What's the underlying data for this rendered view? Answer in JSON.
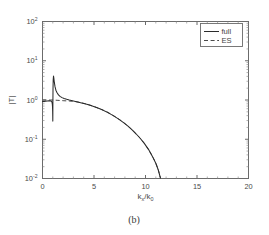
{
  "figure": {
    "caption": "(b)",
    "background": "#ffffff",
    "foreground": "#3a3a3a"
  },
  "chart_data": {
    "type": "line",
    "title": "",
    "subtitle": "",
    "caption": "(b)",
    "xlabel": "k_x/k_0",
    "xlabel_parts": {
      "base1": "k",
      "sub1": "x",
      "slash": "/",
      "base2": "k",
      "sub2": "0"
    },
    "ylabel": "|T|",
    "xscale": "linear",
    "yscale": "log",
    "xlim": [
      0,
      20
    ],
    "ylim": [
      0.01,
      100
    ],
    "grid": false,
    "xticks": [
      0,
      5,
      10,
      15,
      20
    ],
    "xticklabels": [
      "0",
      "5",
      "10",
      "15",
      "20"
    ],
    "yticks": [
      0.01,
      0.1,
      1,
      10,
      100
    ],
    "yticklabels": [
      "10^-2",
      "10^-1",
      "10^0",
      "10^1",
      "10^2"
    ],
    "ytick_mantissa": "10",
    "ytick_exponents": [
      "-2",
      "-1",
      "0",
      "1",
      "2"
    ],
    "minor_ticks": true,
    "legend": {
      "position": "upper right",
      "boxed": true,
      "entries": [
        {
          "name": "full",
          "style": "solid",
          "color": "#2b2b2b"
        },
        {
          "name": "ES",
          "style": "dashed",
          "color": "#4a4a4a"
        }
      ]
    },
    "series": [
      {
        "name": "full",
        "style": "solid",
        "color": "#2b2b2b",
        "x": [
          0.0,
          0.15,
          0.3,
          0.45,
          0.6,
          0.72,
          0.82,
          0.88,
          0.92,
          0.95,
          0.97,
          0.985,
          0.995,
          1.0,
          1.005,
          1.01,
          1.02,
          1.04,
          1.07,
          1.1,
          1.15,
          1.22,
          1.3,
          1.4,
          1.55,
          1.7,
          1.9,
          2.1,
          2.35,
          2.6,
          2.9,
          3.2,
          3.5,
          3.9,
          4.3,
          4.7,
          5.1,
          5.5,
          5.9,
          6.3,
          6.7,
          7.1,
          7.5,
          7.9,
          8.3,
          8.7,
          9.1,
          9.5,
          9.9,
          10.3,
          10.7,
          11.0,
          11.25,
          11.45
        ],
        "y": [
          0.92,
          0.92,
          0.93,
          0.94,
          0.95,
          0.95,
          0.94,
          0.92,
          0.88,
          0.8,
          0.68,
          0.52,
          0.38,
          0.29,
          0.45,
          0.9,
          1.9,
          3.3,
          4.1,
          3.6,
          2.8,
          2.15,
          1.78,
          1.55,
          1.35,
          1.24,
          1.15,
          1.09,
          1.04,
          1.0,
          0.96,
          0.92,
          0.88,
          0.83,
          0.78,
          0.72,
          0.665,
          0.605,
          0.545,
          0.485,
          0.425,
          0.367,
          0.312,
          0.262,
          0.215,
          0.173,
          0.136,
          0.1045,
          0.0775,
          0.0545,
          0.0355,
          0.0245,
          0.0162,
          0.0103
        ]
      },
      {
        "name": "ES",
        "style": "dashed",
        "color": "#4a4a4a",
        "x": [
          0.0,
          0.25,
          0.5,
          0.75,
          1.0,
          1.25,
          1.5,
          1.75,
          2.0,
          2.3,
          2.6,
          2.9,
          3.2,
          3.5,
          3.9,
          4.3,
          4.7,
          5.1,
          5.5,
          5.9,
          6.3,
          6.7,
          7.1,
          7.5,
          7.9,
          8.3,
          8.7,
          9.1,
          9.5,
          9.9,
          10.3,
          10.7,
          11.0,
          11.25,
          11.45
        ],
        "y": [
          1.0,
          1.0,
          1.0,
          1.0,
          1.0,
          0.99,
          0.98,
          0.97,
          0.96,
          0.95,
          0.94,
          0.93,
          0.91,
          0.885,
          0.835,
          0.785,
          0.725,
          0.668,
          0.608,
          0.548,
          0.488,
          0.428,
          0.369,
          0.314,
          0.263,
          0.216,
          0.174,
          0.137,
          0.105,
          0.078,
          0.0548,
          0.0357,
          0.0246,
          0.0163,
          0.0104
        ]
      }
    ]
  }
}
